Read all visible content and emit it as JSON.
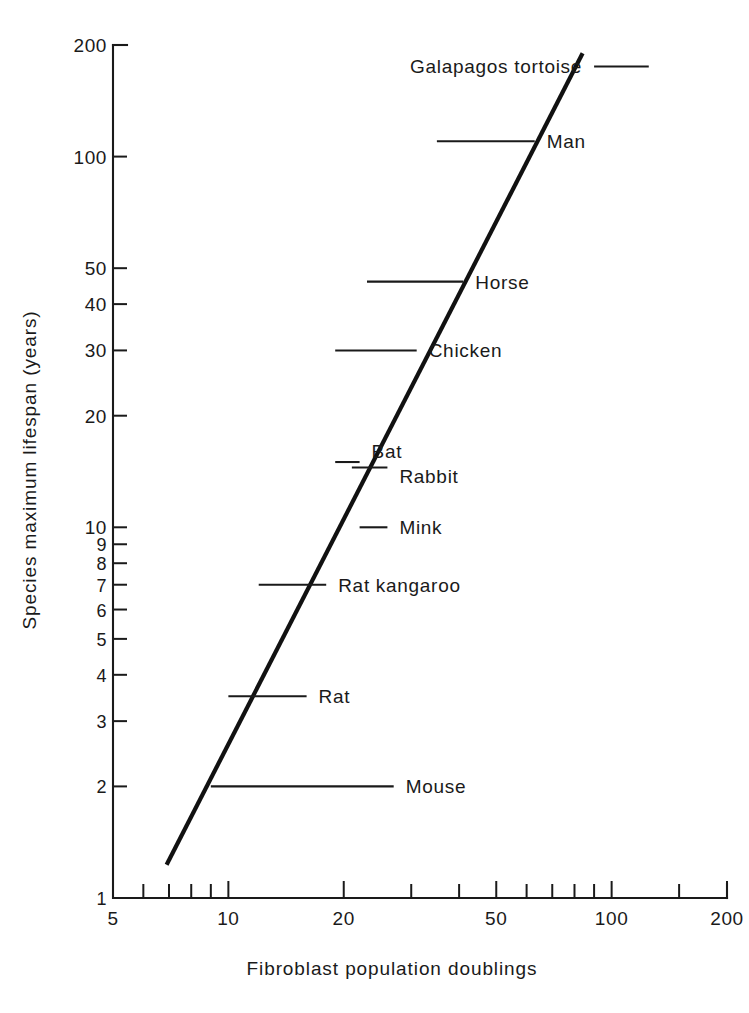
{
  "figure": {
    "title_clipped": "",
    "background_color": "#ffffff",
    "ink_color": "#1a1a1a"
  },
  "chart_data": {
    "type": "scatter",
    "title": "",
    "xlabel": "Fibroblast population doublings",
    "ylabel": "Species maximum lifespan (years)",
    "x_scale": "log",
    "y_scale": "log",
    "xlim": [
      5,
      200
    ],
    "ylim": [
      1,
      200
    ],
    "grid": false,
    "legend": "none",
    "x_ticks_labeled": [
      5,
      10,
      20,
      50,
      100,
      200
    ],
    "x_ticks_minor": [
      6,
      7,
      8,
      9,
      30,
      40,
      60,
      70,
      80,
      90,
      150
    ],
    "y_ticks_labeled": [
      1,
      2,
      3,
      4,
      5,
      6,
      7,
      8,
      9,
      10,
      20,
      30,
      40,
      50,
      100,
      200
    ],
    "x_tick_labels": [
      "5",
      "10",
      "20",
      "50",
      "100",
      "200"
    ],
    "y_tick_labels": [
      "1",
      "2",
      "3",
      "4",
      "5",
      "6",
      "7",
      "8",
      "9",
      "10",
      "20",
      "30",
      "40",
      "50",
      "100",
      "200"
    ],
    "trend_line": {
      "label": "regression line",
      "x_start": 6.9,
      "y_start": 1.23,
      "x_end": 84,
      "y_end": 190
    },
    "points": [
      {
        "name": "Galapagos tortoise",
        "label": "Galapagos tortoise",
        "doublings": 100,
        "lifespan": 175,
        "err_low": 90,
        "err_high": 125,
        "label_side": "left"
      },
      {
        "name": "Man",
        "label": "Man",
        "doublings": 50,
        "lifespan": 110,
        "err_low": 35,
        "err_high": 63,
        "label_side": "right"
      },
      {
        "name": "Horse",
        "label": "Horse",
        "doublings": 39,
        "lifespan": 46,
        "err_low": 23,
        "err_high": 41,
        "label_side": "right"
      },
      {
        "name": "Chicken",
        "label": "Chicken",
        "doublings": 29,
        "lifespan": 30,
        "err_low": 19,
        "err_high": 31,
        "label_side": "right"
      },
      {
        "name": "Bat",
        "label": "Bat",
        "doublings": 21,
        "lifespan": 15,
        "err_low": 19,
        "err_high": 22,
        "label_side": "right"
      },
      {
        "name": "Rabbit",
        "label": "Rabbit",
        "doublings": 22,
        "lifespan": 14.5,
        "err_low": 21,
        "err_high": 26,
        "label_side": "right"
      },
      {
        "name": "Mink",
        "label": "Mink",
        "doublings": 24,
        "lifespan": 10,
        "err_low": 22,
        "err_high": 26,
        "label_side": "right"
      },
      {
        "name": "Rat kangaroo",
        "label": "Rat kangaroo",
        "doublings": 17,
        "lifespan": 7,
        "err_low": 12,
        "err_high": 18,
        "label_side": "right"
      },
      {
        "name": "Rat",
        "label": "Rat",
        "doublings": 14,
        "lifespan": 3.5,
        "err_low": 10,
        "err_high": 16,
        "label_side": "right"
      },
      {
        "name": "Mouse",
        "label": "Mouse",
        "doublings": 15,
        "lifespan": 2,
        "err_low": 9,
        "err_high": 27,
        "label_side": "right"
      }
    ]
  }
}
